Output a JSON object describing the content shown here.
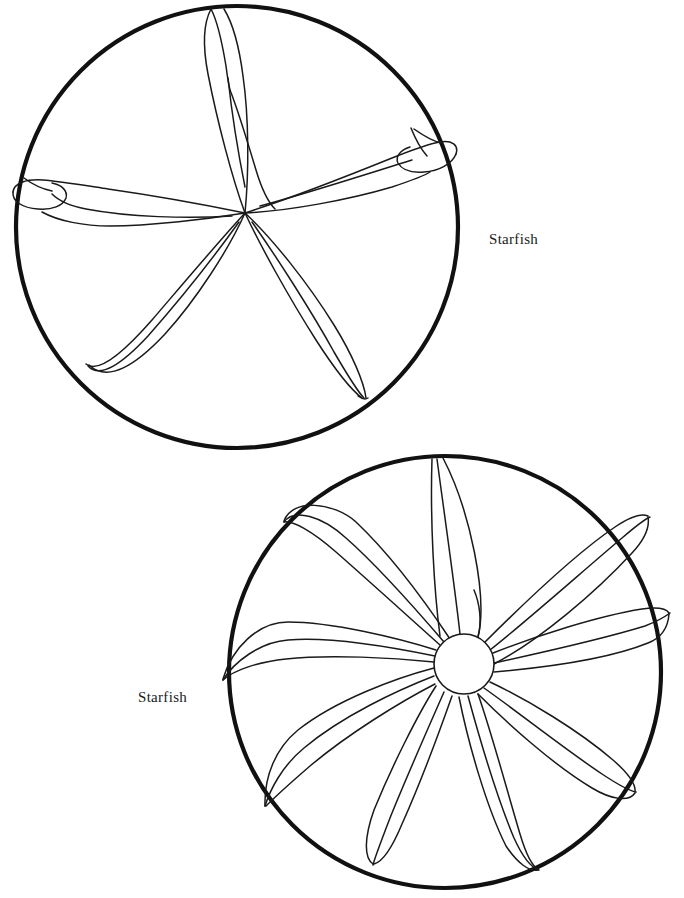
{
  "page": {
    "title": "Starfish",
    "background_color": "#ffffff",
    "width": 684,
    "height": 898,
    "ink_color": "#111111",
    "outline_color": "#1a1a1a"
  },
  "figures": [
    {
      "id": "starfish-top",
      "label": "Starfish",
      "label_position": "right",
      "arm_count": 5,
      "has_central_disc": false,
      "circle": {
        "cx": 237,
        "cy": 227,
        "r": 221,
        "stroke_width": 4.2
      },
      "center": {
        "x": 245,
        "y": 213
      },
      "description": "Five-armed starfish viewed from above, arms of uneven length reaching the circular border, two arms with folded curled tips",
      "arms": [
        {
          "name": "arm-up",
          "angle_deg": -86,
          "tip": {
            "x": 225,
            "y": 10
          },
          "curled_tip": false
        },
        {
          "name": "arm-upper-right",
          "angle_deg": -31,
          "tip": {
            "x": 455,
            "y": 128
          },
          "curled_tip": true
        },
        {
          "name": "arm-lower-right",
          "angle_deg": 62,
          "tip": {
            "x": 364,
            "y": 398
          },
          "curled_tip": false
        },
        {
          "name": "arm-lower-left",
          "angle_deg": 117,
          "tip": {
            "x": 88,
            "y": 364
          },
          "curled_tip": false
        },
        {
          "name": "arm-left",
          "angle_deg": 182,
          "tip": {
            "x": 18,
            "y": 185
          },
          "curled_tip": true
        }
      ]
    },
    {
      "id": "starfish-bottom",
      "label": "Starfish",
      "label_position": "left",
      "arm_count": 7,
      "has_central_disc": true,
      "circle": {
        "cx": 445,
        "cy": 672,
        "r": 216,
        "stroke_width": 4.2
      },
      "center": {
        "x": 464,
        "y": 664
      },
      "central_disc": {
        "cx": 464,
        "cy": 664,
        "r": 30
      },
      "description": "Seven-armed starfish with a round central disc, arms sweeping counter-clockwise in a pinwheel arrangement, each tip meeting the circular border",
      "arms": [
        {
          "name": "arm-1",
          "angle_deg": -95,
          "tip_angle_deg": -80,
          "sweep": "counter-clockwise"
        },
        {
          "name": "arm-2",
          "angle_deg": -44,
          "tip_angle_deg": -27,
          "sweep": "counter-clockwise"
        },
        {
          "name": "arm-3",
          "angle_deg": 7,
          "tip_angle_deg": 22,
          "sweep": "counter-clockwise"
        },
        {
          "name": "arm-4",
          "angle_deg": 58,
          "tip_angle_deg": 72,
          "sweep": "counter-clockwise"
        },
        {
          "name": "arm-5",
          "angle_deg": 110,
          "tip_angle_deg": 122,
          "sweep": "counter-clockwise"
        },
        {
          "name": "arm-6",
          "angle_deg": 162,
          "tip_angle_deg": 176,
          "sweep": "counter-clockwise"
        },
        {
          "name": "arm-7",
          "angle_deg": 213,
          "tip_angle_deg": 226,
          "sweep": "counter-clockwise"
        }
      ]
    }
  ]
}
